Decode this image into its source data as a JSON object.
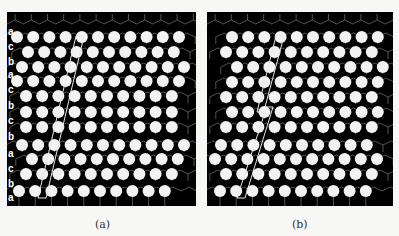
{
  "figure": {
    "background": "#f7f7f5",
    "panel_bg": "#000000",
    "atom_color": "#f2f2f2",
    "bond_color": "#8a8a8a",
    "outline_color": "#e8e8e8",
    "panels": [
      {
        "id": "a",
        "caption": "(a)",
        "box": {
          "x": 7,
          "y": 12,
          "w": 189,
          "h": 194
        },
        "spacing": 16.2,
        "atom_r": 6,
        "stacking_labels": [
          "a",
          "c",
          "b",
          "a",
          "c",
          "b",
          "c",
          "b",
          "a",
          "c",
          "b",
          "a"
        ],
        "rows": [
          {
            "y": 25,
            "x0": 10,
            "n": 11
          },
          {
            "y": 40,
            "x0": 21,
            "n": 10
          },
          {
            "y": 55,
            "x0": 15,
            "n": 11
          },
          {
            "y": 69,
            "x0": 10,
            "n": 11
          },
          {
            "y": 84,
            "x0": 19,
            "n": 10
          },
          {
            "y": 100,
            "x0": 19,
            "n": 10
          },
          {
            "y": 115,
            "x0": 19,
            "n": 10
          },
          {
            "y": 133,
            "x0": 15,
            "n": 11
          },
          {
            "y": 147,
            "x0": 25,
            "n": 10
          },
          {
            "y": 162,
            "x0": 19,
            "n": 10
          },
          {
            "y": 179,
            "x0": 12,
            "n": 10
          }
        ],
        "outline": [
          [
            69,
            24
          ],
          [
            77,
            24
          ],
          [
            39,
            186
          ],
          [
            31,
            186
          ]
        ]
      },
      {
        "id": "b",
        "caption": "(b)",
        "box": {
          "x": 207,
          "y": 12,
          "w": 186,
          "h": 194
        },
        "spacing": 16.2,
        "atom_r": 6,
        "stacking_labels": [],
        "rows": [
          {
            "y": 25,
            "x0": 25,
            "n": 10
          },
          {
            "y": 40,
            "x0": 19,
            "n": 10
          },
          {
            "y": 55,
            "x0": 30,
            "n": 10
          },
          {
            "y": 70,
            "x0": 25,
            "n": 10
          },
          {
            "y": 85,
            "x0": 19,
            "n": 10
          },
          {
            "y": 100,
            "x0": 25,
            "n": 10
          },
          {
            "y": 115,
            "x0": 19,
            "n": 10
          },
          {
            "y": 133,
            "x0": 14,
            "n": 10
          },
          {
            "y": 147,
            "x0": 8,
            "n": 11
          },
          {
            "y": 162,
            "x0": 19,
            "n": 10
          },
          {
            "y": 179,
            "x0": 13,
            "n": 10
          }
        ],
        "outline": [
          [
            69,
            24
          ],
          [
            77,
            24
          ],
          [
            58,
            95
          ],
          [
            66,
            95
          ],
          [
            38,
            186
          ],
          [
            30,
            186
          ],
          [
            58,
            100
          ],
          [
            50,
            100
          ]
        ]
      }
    ]
  }
}
